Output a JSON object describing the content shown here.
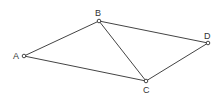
{
  "diagram": {
    "type": "quadrilateral-with-diagonal",
    "vertices": [
      {
        "id": "A",
        "label": "A",
        "x": 24,
        "y": 56,
        "label_x": 13,
        "label_y": 59
      },
      {
        "id": "B",
        "label": "B",
        "x": 99,
        "y": 21,
        "label_x": 95,
        "label_y": 16
      },
      {
        "id": "C",
        "label": "C",
        "x": 146,
        "y": 81,
        "label_x": 143,
        "label_y": 93
      },
      {
        "id": "D",
        "label": "D",
        "x": 208,
        "y": 43,
        "label_x": 204,
        "label_y": 39
      }
    ],
    "edges": [
      {
        "from": "A",
        "to": "B"
      },
      {
        "from": "B",
        "to": "D"
      },
      {
        "from": "D",
        "to": "C"
      },
      {
        "from": "C",
        "to": "A"
      },
      {
        "from": "B",
        "to": "C"
      }
    ],
    "colors": {
      "line": "#444444",
      "vertex_fill": "#ffffff",
      "label": "#333333"
    }
  }
}
